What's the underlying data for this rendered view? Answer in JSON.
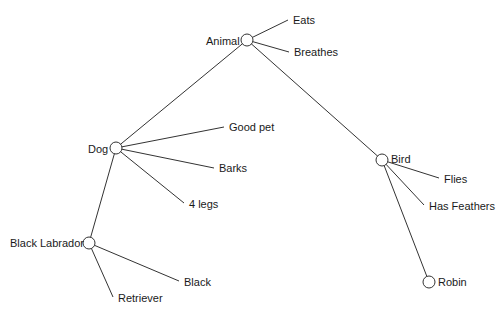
{
  "colors": {
    "line": "#333333",
    "text": "#1a1a1a",
    "background": "#ffffff"
  },
  "nodes": [
    {
      "id": "animal",
      "label": "Animal",
      "x": 247,
      "y": 40
    },
    {
      "id": "dog",
      "label": "Dog",
      "x": 116,
      "y": 148
    },
    {
      "id": "bird",
      "label": "Bird",
      "x": 382,
      "y": 160
    },
    {
      "id": "black_labrador",
      "label": "Black Labrador",
      "x": 89,
      "y": 243
    },
    {
      "id": "robin",
      "label": "Robin",
      "x": 429,
      "y": 282
    }
  ],
  "properties": [
    {
      "parent": "animal",
      "label": "Eats",
      "x": 290,
      "y": 20
    },
    {
      "parent": "animal",
      "label": "Breathes",
      "x": 291,
      "y": 52
    },
    {
      "parent": "dog",
      "label": "Good pet",
      "x": 226,
      "y": 127
    },
    {
      "parent": "dog",
      "label": "Barks",
      "x": 216,
      "y": 167
    },
    {
      "parent": "dog",
      "label": "4 legs",
      "x": 186,
      "y": 204
    },
    {
      "parent": "bird",
      "label": "Flies",
      "x": 441,
      "y": 178
    },
    {
      "parent": "bird",
      "label": "Has Feathers",
      "x": 426,
      "y": 205
    },
    {
      "parent": "black_labrador",
      "label": "Black",
      "x": 181,
      "y": 281
    },
    {
      "parent": "black_labrador",
      "label": "Retriever",
      "x": 115,
      "y": 297
    }
  ],
  "links": [
    [
      "animal",
      "dog"
    ],
    [
      "animal",
      "bird"
    ],
    [
      "dog",
      "black_labrador"
    ],
    [
      "bird",
      "robin"
    ]
  ]
}
